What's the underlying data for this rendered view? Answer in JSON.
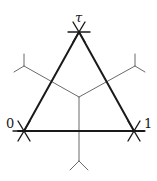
{
  "diagram": {
    "labels": {
      "top": "τ",
      "left": "0",
      "right": "1"
    },
    "colors": {
      "triangle": "#1a1a1a",
      "dual_edges": "#6a6a6a",
      "background": "#ffffff"
    },
    "vertices": {
      "top": [
        79,
        32
      ],
      "left": [
        24,
        131
      ],
      "right": [
        134,
        131
      ]
    },
    "center": [
      79,
      97
    ],
    "dual_ends": {
      "upper_left": [
        24,
        66
      ],
      "upper_right": [
        135,
        66
      ],
      "bottom": [
        79,
        171
      ]
    }
  }
}
